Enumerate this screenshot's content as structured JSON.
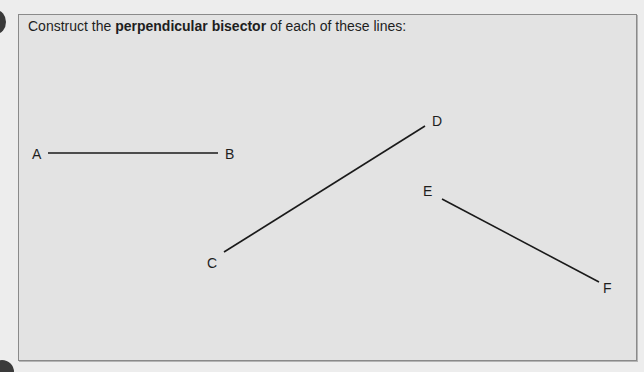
{
  "question": {
    "instruction_prefix": "Construct the ",
    "instruction_bold": "perpendicular bisector",
    "instruction_suffix": " of each of these lines:"
  },
  "line_segments": [
    {
      "name": "AB",
      "start": {
        "label": "A",
        "x": 48,
        "y": 153
      },
      "end": {
        "label": "B",
        "x": 218,
        "y": 153
      }
    },
    {
      "name": "CD",
      "start": {
        "label": "C",
        "x": 224,
        "y": 252
      },
      "end": {
        "label": "D",
        "x": 425,
        "y": 126
      }
    },
    {
      "name": "EF",
      "start": {
        "label": "E",
        "x": 442,
        "y": 199
      },
      "end": {
        "label": "F",
        "x": 599,
        "y": 282
      }
    }
  ],
  "labels": {
    "A": "A",
    "B": "B",
    "C": "C",
    "D": "D",
    "E": "E",
    "F": "F"
  },
  "colors": {
    "panel_background": "#e3e3e3",
    "panel_border": "#8a8a8a",
    "line": "#1a1a1a",
    "text": "#1e1e1e"
  }
}
